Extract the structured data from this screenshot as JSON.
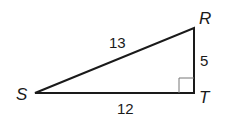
{
  "diagram": {
    "type": "right-triangle",
    "vertices": {
      "S": {
        "label": "S",
        "x": 35,
        "y": 93
      },
      "T": {
        "label": "T",
        "x": 194,
        "y": 93
      },
      "R": {
        "label": "R",
        "x": 194,
        "y": 28
      }
    },
    "sides": {
      "SR": {
        "label": "13"
      },
      "RT": {
        "label": "5"
      },
      "ST": {
        "label": "12"
      }
    },
    "right_angle_at": "T",
    "colors": {
      "stroke": "#1a1a1a",
      "marker": "#777777",
      "background": "#ffffff"
    }
  }
}
